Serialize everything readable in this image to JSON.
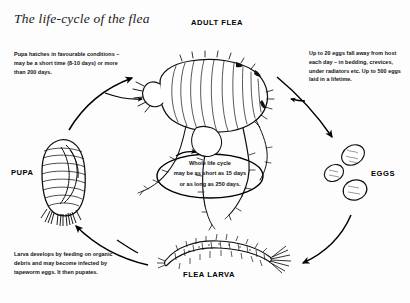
{
  "diagram": {
    "title": "The life-cycle of the flea",
    "type": "cycle-diagram",
    "stage_labels": {
      "adult": "ADULT FLEA",
      "eggs": "EGGS",
      "pupa": "PUPA",
      "larva": "FLEA LARVA"
    },
    "center_note": {
      "line1": "Whole life cycle",
      "line2": "may be as short as 15 days",
      "line3": "or as long as 250 days."
    },
    "notes": {
      "pupa_hatching": "Pupa hatches in favourable conditions – may be a short time (8-10 days) or more than 200 days.",
      "egg_laying": "Up to 20 eggs fall away from host each day – in bedding, crevices, under radiators etc. Up to 500 eggs laid in a lifetime.",
      "larva_development": "Larva develops by feeding on organic debris and may become infected by tapeworm eggs. It then pupates."
    },
    "illustrations": {
      "adult_flea": "adult-flea-illustration",
      "eggs": "flea-eggs-illustration",
      "pupa": "flea-pupa-illustration",
      "larva": "flea-larva-illustration"
    },
    "arrows": [
      {
        "name": "adult-to-eggs",
        "from": "ADULT FLEA",
        "to": "EGGS"
      },
      {
        "name": "eggs-to-larva",
        "from": "EGGS",
        "to": "FLEA LARVA"
      },
      {
        "name": "larva-to-pupa",
        "from": "FLEA LARVA",
        "to": "PUPA"
      },
      {
        "name": "pupa-to-adult",
        "from": "PUPA",
        "to": "ADULT FLEA"
      }
    ],
    "colors": {
      "ink": "#000000",
      "background": "#fdfdfd",
      "title_ink": "#1a1a1a"
    }
  }
}
